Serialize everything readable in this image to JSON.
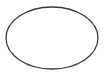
{
  "diagram": {
    "shapes": [
      {
        "type": "ellipse",
        "cx": 52,
        "cy": 38,
        "rx": 46,
        "ry": 31,
        "stroke": "#3a3a3a",
        "stroke_width": 1.3,
        "fill": "none"
      }
    ],
    "background": "#ffffff"
  }
}
